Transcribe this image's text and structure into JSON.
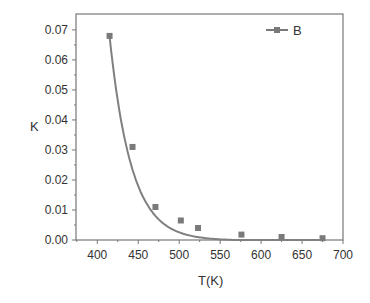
{
  "chart_data": {
    "type": "line",
    "title": "",
    "xlabel": "T(K)",
    "ylabel": "K",
    "xlim": [
      374,
      700
    ],
    "ylim": [
      0,
      0.0753
    ],
    "xticks": [
      400,
      450,
      500,
      550,
      600,
      650,
      700
    ],
    "xtick_labels": [
      "400",
      "450",
      "500",
      "550",
      "600",
      "650",
      "700"
    ],
    "yticks": [
      0,
      0.01,
      0.02,
      0.03,
      0.04,
      0.05,
      0.06,
      0.07
    ],
    "ytick_labels": [
      "0.00",
      "0.01",
      "0.02",
      "0.03",
      "0.04",
      "0.05",
      "0.06",
      "0.07"
    ],
    "grid": false,
    "legend_position": "upper right",
    "series": [
      {
        "name": "B",
        "marker": "square",
        "color": "#7a7a7a",
        "x": [
          415,
          443,
          471,
          502,
          523,
          576,
          625,
          675
        ],
        "y": [
          0.068,
          0.031,
          0.011,
          0.0065,
          0.004,
          0.0018,
          0.001,
          0.0006
        ]
      }
    ],
    "fit_curve": {
      "type": "exponential decay",
      "color": "#808080"
    }
  },
  "legend": {
    "label": "B"
  }
}
